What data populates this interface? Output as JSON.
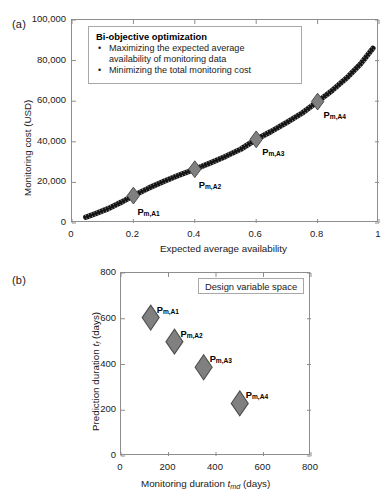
{
  "figure": {
    "panel_a_label": "(a)",
    "panel_b_label": "(b)"
  },
  "panel_a": {
    "annotation": {
      "title": "Bi-objective optimization",
      "bullet_glyph": "•",
      "items": [
        "Maximizing the expected average availability of monitoring data",
        "Minimizing the total monitoring cost"
      ],
      "item_lines": [
        [
          "Maximizing the expected average",
          "availability of monitoring data"
        ],
        [
          "Minimizing the total monitoring cost"
        ]
      ]
    },
    "xlabel": "Expected average availability",
    "ylabel": "Monitoring cost (USD)",
    "x_ticks": [
      "0",
      "0.2",
      "0.4",
      "0.6",
      "0.8",
      "1"
    ],
    "y_ticks": [
      "0",
      "20,000",
      "40,000",
      "60,000",
      "80,000",
      "100,000"
    ],
    "point_labels": [
      {
        "base": "P",
        "sub": "m,A1"
      },
      {
        "base": "P",
        "sub": "m,A2"
      },
      {
        "base": "P",
        "sub": "m,A3"
      },
      {
        "base": "P",
        "sub": "m,A4"
      }
    ]
  },
  "panel_b": {
    "annotation": {
      "title": "Design variable space"
    },
    "xlabel_pre": "Monitoring duration ",
    "xlabel_var": "t",
    "xlabel_sub": "md",
    "xlabel_post": " (days)",
    "ylabel_pre": "Prediction duration ",
    "ylabel_var": "t",
    "ylabel_sub": "f",
    "ylabel_post": " (days)",
    "x_ticks": [
      "0",
      "200",
      "400",
      "600",
      "800"
    ],
    "y_ticks": [
      "0",
      "200",
      "400",
      "600",
      "800"
    ],
    "point_labels": [
      {
        "base": "P",
        "sub": "m,A1"
      },
      {
        "base": "P",
        "sub": "m,A2"
      },
      {
        "base": "P",
        "sub": "m,A3"
      },
      {
        "base": "P",
        "sub": "m,A4"
      }
    ]
  },
  "colors": {
    "marker_fill": "#808080",
    "marker_edge": "#4d4d4d",
    "curve": "#141414",
    "axis": "#8d8d8d",
    "text": "#1a1a1a"
  },
  "chart_data": [
    {
      "type": "line",
      "panel": "(a)",
      "title": "Bi-objective optimization",
      "xlabel": "Expected average availability",
      "ylabel": "Monitoring cost (USD)",
      "xlim": [
        0,
        1
      ],
      "ylim": [
        0,
        100000
      ],
      "xticks": [
        0,
        0.2,
        0.4,
        0.6,
        0.8,
        1
      ],
      "yticks": [
        0,
        20000,
        40000,
        60000,
        80000,
        100000
      ],
      "grid": false,
      "legend": "none",
      "series": [
        {
          "name": "Pareto front",
          "style": "dense-dotted-thick-black",
          "x": [
            0.045,
            0.08,
            0.12,
            0.16,
            0.2,
            0.25,
            0.3,
            0.35,
            0.4,
            0.45,
            0.5,
            0.55,
            0.6,
            0.65,
            0.7,
            0.75,
            0.8,
            0.85,
            0.9,
            0.94,
            0.98
          ],
          "y": [
            2800,
            4800,
            7200,
            10200,
            13500,
            17200,
            20600,
            23600,
            26500,
            29600,
            32800,
            36400,
            41200,
            45200,
            49600,
            54200,
            59800,
            65600,
            72200,
            78400,
            86000
          ]
        }
      ],
      "markers": [
        {
          "label": "P_m,A1",
          "x": 0.2,
          "y": 13500
        },
        {
          "label": "P_m,A2",
          "x": 0.4,
          "y": 26500
        },
        {
          "label": "P_m,A3",
          "x": 0.6,
          "y": 41200
        },
        {
          "label": "P_m,A4",
          "x": 0.8,
          "y": 59800
        }
      ]
    },
    {
      "type": "scatter",
      "panel": "(b)",
      "title": "Design variable space",
      "xlabel": "Monitoring duration t_md (days)",
      "ylabel": "Prediction duration t_f (days)",
      "xlim": [
        0,
        800
      ],
      "ylim": [
        0,
        800
      ],
      "xticks": [
        0,
        200,
        400,
        600,
        800
      ],
      "yticks": [
        0,
        200,
        400,
        600,
        800
      ],
      "grid": false,
      "legend": "none",
      "points": [
        {
          "label": "P_m,A1",
          "x": 125,
          "y": 605
        },
        {
          "label": "P_m,A2",
          "x": 225,
          "y": 500
        },
        {
          "label": "P_m,A3",
          "x": 348,
          "y": 388
        },
        {
          "label": "P_m,A4",
          "x": 500,
          "y": 230
        }
      ]
    }
  ]
}
